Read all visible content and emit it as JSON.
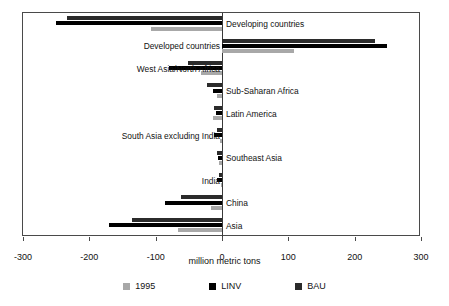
{
  "chart_data": {
    "type": "bar",
    "orientation": "horizontal",
    "title": "",
    "xlabel": "million metric tons",
    "ylabel": "",
    "xlim": [
      -300,
      300
    ],
    "xticks": [
      -300,
      -200,
      -100,
      0,
      100,
      200,
      300
    ],
    "xtick_labels": [
      "-300",
      "-200",
      "-100",
      "0",
      "100",
      "200",
      "300"
    ],
    "grid": false,
    "legend_position": "bottom",
    "categories": [
      "Developing countries",
      "Developed countries",
      "West Asia/North Africa",
      "Sub-Saharan Africa",
      "Latin America",
      "South Asia excluding India",
      "Southeast Asia",
      "India",
      "China",
      "Asia"
    ],
    "label_side": [
      "right",
      "left",
      "left",
      "right",
      "right",
      "left",
      "right",
      "left",
      "right",
      "right"
    ],
    "series": [
      {
        "name": "BAU",
        "color": "#2b2b2b",
        "values": [
          -233,
          231,
          -52,
          -22,
          -12,
          -8,
          -8,
          -5,
          -62,
          -136
        ]
      },
      {
        "name": "LINV",
        "color": "#000000",
        "values": [
          -250,
          248,
          -80,
          -14,
          -9,
          -12,
          -6,
          -8,
          -86,
          -170
        ]
      },
      {
        "name": "1995",
        "color": "#a8a8a8",
        "values": [
          -107,
          108,
          -32,
          -7,
          -14,
          -3,
          -4,
          -2,
          -16,
          -66
        ]
      }
    ],
    "legend": [
      {
        "label": "1995",
        "color": "#a8a8a8"
      },
      {
        "label": "LINV",
        "color": "#000000"
      },
      {
        "label": "BAU",
        "color": "#2b2b2b"
      }
    ]
  }
}
